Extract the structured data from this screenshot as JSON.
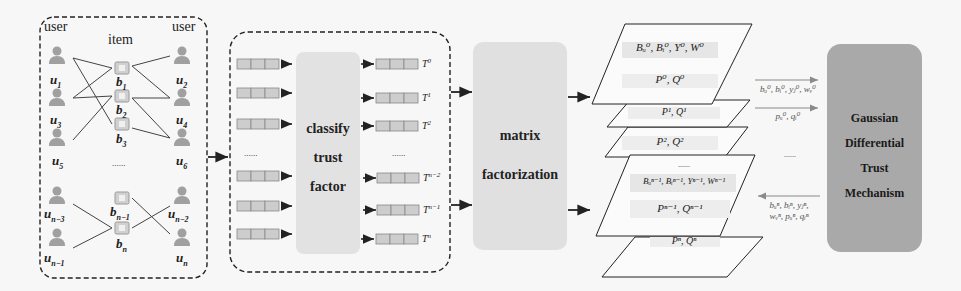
{
  "panel_bipartite": {
    "header_user_left": "user",
    "header_item": "item",
    "header_user_right": "user",
    "left_users": [
      {
        "label": "u",
        "sub": "1"
      },
      {
        "label": "u",
        "sub": "3"
      },
      {
        "label": "u",
        "sub": "5"
      },
      {
        "label": "u",
        "sub": "n−3"
      },
      {
        "label": "u",
        "sub": "n−1"
      }
    ],
    "items": [
      {
        "label": "b",
        "sub": "1"
      },
      {
        "label": "b",
        "sub": "2"
      },
      {
        "label": "b",
        "sub": "3"
      },
      {
        "label": "b",
        "sub": "n−1"
      },
      {
        "label": "b",
        "sub": "n"
      }
    ],
    "right_users": [
      {
        "label": "u",
        "sub": "2"
      },
      {
        "label": "u",
        "sub": "4"
      },
      {
        "label": "u",
        "sub": "6"
      },
      {
        "label": "u",
        "sub": "n−2"
      },
      {
        "label": "u",
        "sub": "n"
      }
    ],
    "ellipsis": "......"
  },
  "panel_classify": {
    "center_label_lines": [
      "classify",
      "trust",
      "factor"
    ],
    "ellipsis_left": "......",
    "ellipsis_right": "......",
    "outputs": [
      {
        "label": "T",
        "sup": "0"
      },
      {
        "label": "T",
        "sup": "1"
      },
      {
        "label": "T",
        "sup": "2"
      },
      {
        "label": "T",
        "sup": "n−2"
      },
      {
        "label": "T",
        "sup": "n−1"
      },
      {
        "label": "T",
        "sup": "n"
      }
    ]
  },
  "panel_matrix": {
    "label_lines": [
      "matrix",
      "factorization"
    ]
  },
  "layers": {
    "top_header": "Bᵤ⁰, Bᵢ⁰, Y⁰, W⁰",
    "layer0": "P⁰, Q⁰",
    "layer1": "P¹, Q¹",
    "layer2": "P², Q²",
    "ellipsis": "......",
    "bottom_header": "Bᵤⁿ⁻¹, Bᵢⁿ⁻¹, Yⁿ⁻¹, Wⁿ⁻¹",
    "layer_n1": "Pⁿ⁻¹, Qⁿ⁻¹",
    "layer_n": "Pⁿ, Qⁿ"
  },
  "transfer": {
    "arrow1_label": "bᵤ⁰, bᵢ⁰, yⱼ⁰, wᵥ⁰",
    "arrow2_label": "pᵤ⁰, qᵢ⁰",
    "ellipsis": "......",
    "return_label_line1": "bᵤⁿ, bᵢⁿ, yⱼⁿ,",
    "return_label_line2": "wᵥⁿ, pᵤⁿ, qᵢⁿ"
  },
  "panel_gdtm": {
    "label_lines": [
      "Gaussian",
      "Differential",
      "Trust",
      "Mechanism"
    ]
  },
  "colors": {
    "background": "#f7f7f7",
    "line": "#333333",
    "light_box": "#e3e3e3",
    "gdtm_box": "#a9a9a9",
    "cell_fill": "#cfcfcf",
    "icon": "#9a9a9a",
    "arrow_gray": "#8a8a8a"
  }
}
